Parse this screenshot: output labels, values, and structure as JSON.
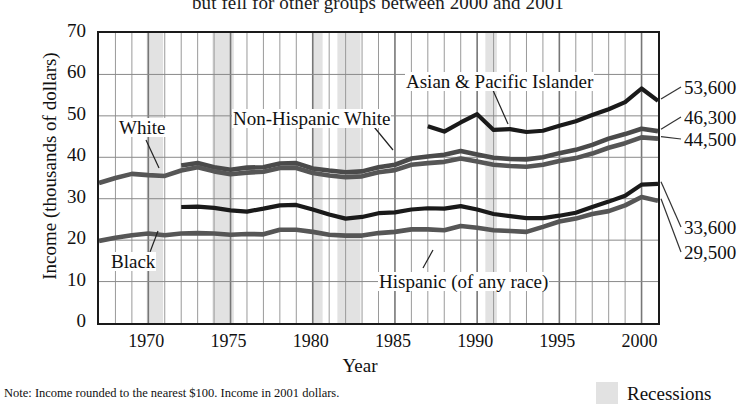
{
  "chart_data": {
    "type": "line",
    "title": "but fell for other groups between 2000 and 2001",
    "xlabel": "Year",
    "ylabel": "Income (thousands of dollars)",
    "xlim": [
      1967,
      2001
    ],
    "ylim": [
      0,
      70
    ],
    "yticks": [
      0,
      10,
      20,
      30,
      40,
      50,
      60,
      70
    ],
    "xticks": [
      1970,
      1975,
      1980,
      1985,
      1990,
      1995,
      2000
    ],
    "grid": true,
    "legend_position": "inline-labels",
    "note": "Note: Income rounded to the nearest $100. Income in 2001 dollars.",
    "legend": [
      {
        "label": "Recessions",
        "color": "#e2e2e2",
        "type": "band"
      }
    ],
    "recessions": [
      {
        "start": 1969.9,
        "end": 1970.9
      },
      {
        "start": 1973.9,
        "end": 1975.2
      },
      {
        "start": 1980.0,
        "end": 1980.6
      },
      {
        "start": 1981.5,
        "end": 1982.9
      },
      {
        "start": 1990.5,
        "end": 1991.2
      }
    ],
    "series": [
      {
        "name": "Asian & Pacific Islander",
        "color": "#1a1a1a",
        "width": 4.2,
        "end_value": "53,600",
        "label_x": 405,
        "label_y": 72,
        "leader": [
          [
            492,
            88
          ],
          [
            508,
            124
          ]
        ],
        "x": [
          1987,
          1988,
          1989,
          1990,
          1991,
          1992,
          1993,
          1994,
          1995,
          1996,
          1997,
          1998,
          1999,
          2000,
          2001
        ],
        "y": [
          47.5,
          46.2,
          48.4,
          50.4,
          46.6,
          46.8,
          46.1,
          46.4,
          47.6,
          48.7,
          50.2,
          51.6,
          53.3,
          56.6,
          53.6
        ]
      },
      {
        "name": "Non-Hispanic White",
        "color": "#4a4a4a",
        "width": 4.6,
        "end_value": "46,300",
        "label_x": 232,
        "label_y": 109,
        "leader": [
          [
            370,
            122
          ],
          [
            393,
            150
          ]
        ],
        "x": [
          1972,
          1973,
          1974,
          1975,
          1976,
          1977,
          1978,
          1979,
          1980,
          1981,
          1982,
          1983,
          1984,
          1985,
          1986,
          1987,
          1988,
          1989,
          1990,
          1991,
          1992,
          1993,
          1994,
          1995,
          1996,
          1997,
          1998,
          1999,
          2000,
          2001
        ],
        "y": [
          38.0,
          38.6,
          37.6,
          37.0,
          37.5,
          37.6,
          38.5,
          38.6,
          37.3,
          36.8,
          36.4,
          36.6,
          37.6,
          38.2,
          39.7,
          40.2,
          40.6,
          41.5,
          40.7,
          39.9,
          39.6,
          39.5,
          40.0,
          41.0,
          41.8,
          43.0,
          44.5,
          45.6,
          46.9,
          46.3
        ]
      },
      {
        "name": "White",
        "color": "#565656",
        "width": 4.6,
        "end_value": "44,500",
        "label_x": 118,
        "label_y": 118,
        "leader": [
          [
            146,
            140
          ],
          [
            159,
            168
          ]
        ],
        "x": [
          1967,
          1968,
          1969,
          1970,
          1971,
          1972,
          1973,
          1974,
          1975,
          1976,
          1977,
          1978,
          1979,
          1980,
          1981,
          1982,
          1983,
          1984,
          1985,
          1986,
          1987,
          1988,
          1989,
          1990,
          1991,
          1992,
          1993,
          1994,
          1995,
          1996,
          1997,
          1998,
          1999,
          2000,
          2001
        ],
        "y": [
          33.8,
          35.0,
          36.0,
          35.7,
          35.5,
          36.8,
          37.6,
          36.6,
          35.9,
          36.3,
          36.5,
          37.4,
          37.4,
          36.2,
          35.6,
          35.2,
          35.4,
          36.4,
          36.9,
          38.2,
          38.6,
          38.9,
          39.7,
          39.0,
          38.2,
          37.9,
          37.7,
          38.2,
          39.1,
          39.8,
          40.9,
          42.3,
          43.4,
          44.8,
          44.5
        ]
      },
      {
        "name": "Hispanic (of any race)",
        "color": "#1a1a1a",
        "width": 4.2,
        "end_value": "33,600",
        "label_x": 378,
        "label_y": 272,
        "leader": [
          [
            423,
            268
          ],
          [
            433,
            250
          ]
        ],
        "x": [
          1972,
          1973,
          1974,
          1975,
          1976,
          1977,
          1978,
          1979,
          1980,
          1981,
          1982,
          1983,
          1984,
          1985,
          1986,
          1987,
          1988,
          1989,
          1990,
          1991,
          1992,
          1993,
          1994,
          1995,
          1996,
          1997,
          1998,
          1999,
          2000,
          2001
        ],
        "y": [
          28.0,
          28.1,
          27.8,
          27.2,
          26.9,
          27.6,
          28.4,
          28.5,
          27.4,
          26.2,
          25.2,
          25.6,
          26.5,
          26.7,
          27.4,
          27.7,
          27.6,
          28.2,
          27.4,
          26.3,
          25.8,
          25.3,
          25.3,
          25.9,
          26.6,
          28.0,
          29.3,
          30.7,
          33.4,
          33.6
        ]
      },
      {
        "name": "Black",
        "color": "#565656",
        "width": 4.6,
        "end_value": "29,500",
        "label_x": 110,
        "label_y": 252,
        "leader": [
          [
            150,
            252
          ],
          [
            158,
            231
          ]
        ],
        "x": [
          1967,
          1968,
          1969,
          1970,
          1971,
          1972,
          1973,
          1974,
          1975,
          1976,
          1977,
          1978,
          1979,
          1980,
          1981,
          1982,
          1983,
          1984,
          1985,
          1986,
          1987,
          1988,
          1989,
          1990,
          1991,
          1992,
          1993,
          1994,
          1995,
          1996,
          1997,
          1998,
          1999,
          2000,
          2001
        ],
        "y": [
          19.8,
          20.6,
          21.2,
          21.6,
          21.2,
          21.6,
          21.7,
          21.6,
          21.3,
          21.5,
          21.4,
          22.5,
          22.5,
          22.0,
          21.3,
          21.1,
          21.1,
          21.7,
          22.0,
          22.6,
          22.6,
          22.4,
          23.4,
          23.0,
          22.4,
          22.2,
          22.0,
          23.2,
          24.5,
          25.2,
          26.3,
          27.0,
          28.4,
          30.4,
          29.5
        ]
      }
    ]
  }
}
